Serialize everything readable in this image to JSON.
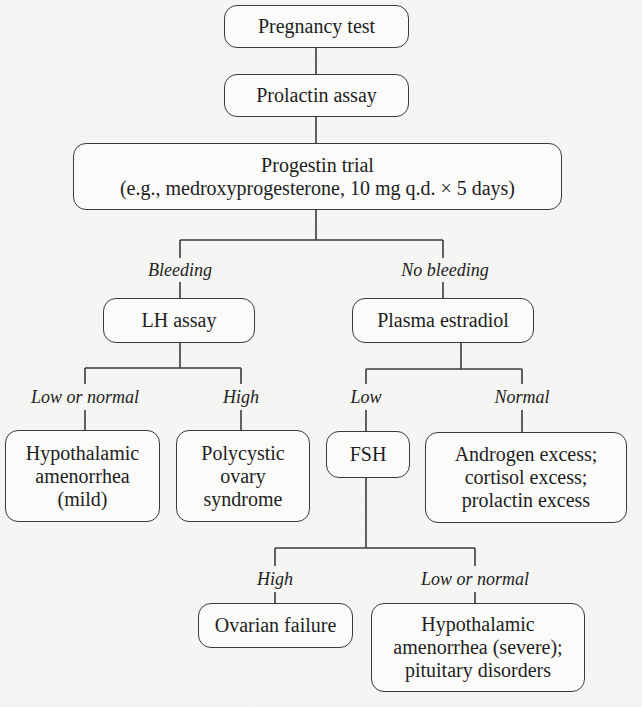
{
  "diagram": {
    "type": "flowchart",
    "nodes": {
      "pregnancy_test": {
        "lines": [
          "Pregnancy test"
        ]
      },
      "prolactin_assay": {
        "lines": [
          "Prolactin assay"
        ]
      },
      "progestin_trial": {
        "lines": [
          "Progestin trial",
          "(e.g., medroxyprogesterone, 10 mg q.d. × 5 days)"
        ]
      },
      "lh_assay": {
        "lines": [
          "LH assay"
        ]
      },
      "plasma_estradiol": {
        "lines": [
          "Plasma estradiol"
        ]
      },
      "hypothalamic_mild": {
        "lines": [
          "Hypothalamic",
          "amenorrhea",
          "(mild)"
        ]
      },
      "polycystic": {
        "lines": [
          "Polycystic",
          "ovary",
          "syndrome"
        ]
      },
      "fsh": {
        "lines": [
          "FSH"
        ]
      },
      "androgen_excess": {
        "lines": [
          "Androgen excess;",
          "cortisol excess;",
          "prolactin excess"
        ]
      },
      "ovarian_failure": {
        "lines": [
          "Ovarian failure"
        ]
      },
      "hypothalamic_severe": {
        "lines": [
          "Hypothalamic",
          "amenorrhea (severe);",
          "pituitary disorders"
        ]
      }
    },
    "edge_labels": {
      "bleeding": "Bleeding",
      "no_bleeding": "No bleeding",
      "lh_low_or_normal": "Low or normal",
      "lh_high": "High",
      "estradiol_low": "Low",
      "estradiol_normal": "Normal",
      "fsh_high": "High",
      "fsh_low_or_normal": "Low or normal"
    },
    "edges": [
      {
        "from": "pregnancy_test",
        "to": "prolactin_assay",
        "label": ""
      },
      {
        "from": "prolactin_assay",
        "to": "progestin_trial",
        "label": ""
      },
      {
        "from": "progestin_trial",
        "to": "lh_assay",
        "label": "Bleeding"
      },
      {
        "from": "progestin_trial",
        "to": "plasma_estradiol",
        "label": "No bleeding"
      },
      {
        "from": "lh_assay",
        "to": "hypothalamic_mild",
        "label": "Low or normal"
      },
      {
        "from": "lh_assay",
        "to": "polycystic",
        "label": "High"
      },
      {
        "from": "plasma_estradiol",
        "to": "fsh",
        "label": "Low"
      },
      {
        "from": "plasma_estradiol",
        "to": "androgen_excess",
        "label": "Normal"
      },
      {
        "from": "fsh",
        "to": "ovarian_failure",
        "label": "High"
      },
      {
        "from": "fsh",
        "to": "hypothalamic_severe",
        "label": "Low or normal"
      }
    ]
  },
  "colors": {
    "background": "#f5f5f3",
    "box_fill": "#fbfbfa",
    "stroke": "#3a3a3a",
    "text": "#1e1e1e"
  }
}
